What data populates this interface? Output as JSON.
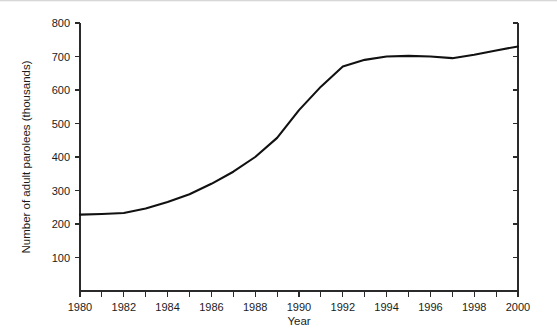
{
  "chart_data": {
    "type": "line",
    "title": "",
    "xlabel": "Year",
    "ylabel": "Number of adult parolees (thousands)",
    "xlim": [
      1980,
      2000
    ],
    "ylim": [
      0,
      800
    ],
    "grid": false,
    "legend": null,
    "x_tick_labels": [
      "1980",
      "1982",
      "1984",
      "1986",
      "1988",
      "1990",
      "1992",
      "1994",
      "1996",
      "1998",
      "2000"
    ],
    "x_tick_values": [
      1980,
      1982,
      1984,
      1986,
      1988,
      1990,
      1992,
      1994,
      1996,
      1998,
      2000
    ],
    "x_minor_ticks": [
      1981,
      1983,
      1985,
      1987,
      1989,
      1991,
      1993,
      1995,
      1997,
      1999
    ],
    "y_tick_labels": [
      "100",
      "200",
      "300",
      "400",
      "500",
      "600",
      "700",
      "800"
    ],
    "y_tick_values": [
      100,
      200,
      300,
      400,
      500,
      600,
      700,
      800
    ],
    "line_color": "#111111",
    "axis_color": "#2a2a2a",
    "x": [
      1980,
      1981,
      1982,
      1983,
      1984,
      1985,
      1986,
      1987,
      1988,
      1989,
      1990,
      1991,
      1992,
      1993,
      1994,
      1995,
      1996,
      1997,
      1998,
      1999,
      2000
    ],
    "values": [
      228,
      230,
      233,
      246,
      266,
      289,
      320,
      356,
      400,
      457,
      540,
      610,
      670,
      690,
      700,
      702,
      700,
      695,
      705,
      718,
      730
    ],
    "series": [
      {
        "name": "Adult parolees",
        "values": [
          228,
          230,
          233,
          246,
          266,
          289,
          320,
          356,
          400,
          457,
          540,
          610,
          670,
          690,
          700,
          702,
          700,
          695,
          705,
          718,
          730
        ]
      }
    ]
  }
}
